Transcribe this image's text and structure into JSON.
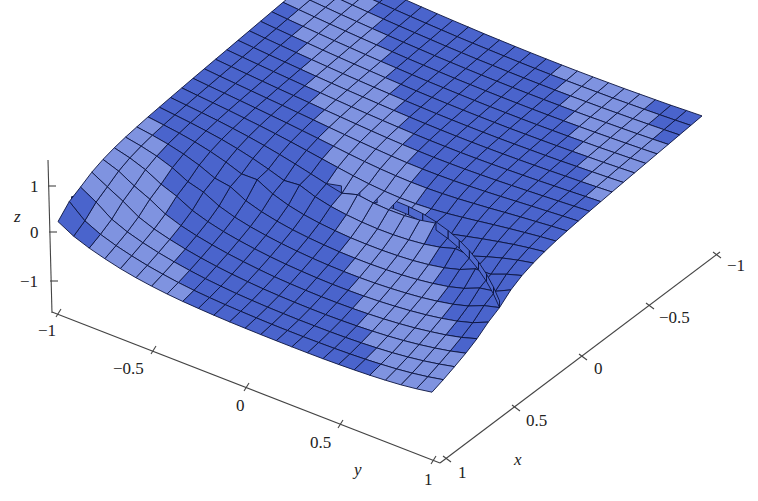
{
  "chart_data": {
    "type": "surface3d",
    "title": "",
    "xlabel": "x",
    "ylabel": "y",
    "zlabel": "z",
    "x_ticks": [
      "1",
      "0.5",
      "0",
      "-0.5",
      "-1"
    ],
    "y_ticks": [
      "-1",
      "-0.5",
      "0",
      "0.5",
      "1"
    ],
    "z_ticks": [
      "1",
      "0",
      "-1"
    ],
    "xlim": [
      -1,
      1
    ],
    "ylim": [
      -1,
      1
    ],
    "zlim": [
      -1.5,
      1.5
    ],
    "grid_resolution": 24,
    "surface_color": "#4a64cc",
    "mesh_color": "#0b1440",
    "features": [
      "low sheet near z=0 on the front (x near 1, y near -1) curving upward",
      "high sheet near z=1 at the back (x near -1, y near 1)",
      "vertical jump walls along the discontinuity curve"
    ]
  },
  "axes": {
    "z": {
      "label": "z",
      "ticks": [
        {
          "label": "1"
        },
        {
          "label": "0"
        },
        {
          "label": "−1"
        }
      ]
    },
    "y": {
      "label": "y",
      "ticks": [
        {
          "label": "−1"
        },
        {
          "label": "−0.5"
        },
        {
          "label": "0"
        },
        {
          "label": "0.5"
        },
        {
          "label": "1"
        }
      ]
    },
    "x": {
      "label": "x",
      "ticks": [
        {
          "label": "1"
        },
        {
          "label": "0.5"
        },
        {
          "label": "0"
        },
        {
          "label": "−0.5"
        },
        {
          "label": "−1"
        }
      ]
    }
  },
  "colors": {
    "surface": "#4a64cc",
    "surface_light": "#7f93e0",
    "mesh": "#0b1440",
    "axis": "#444444",
    "background": "#ffffff"
  }
}
